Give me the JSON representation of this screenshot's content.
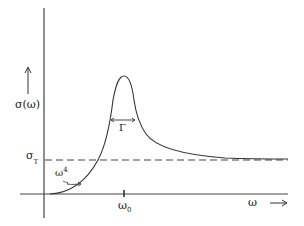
{
  "diagram": {
    "title": "",
    "y_axis_label": "σ(ω)",
    "x_axis_label": "ω",
    "threshold_label": "σ",
    "threshold_sub": "T",
    "peak_tick_label": "ω",
    "peak_tick_sub": "0",
    "width_label": "Γ",
    "low_freq_label": "ω",
    "low_freq_sup": "4",
    "colors": {
      "line": "#333333",
      "background": "#ffffff"
    }
  }
}
